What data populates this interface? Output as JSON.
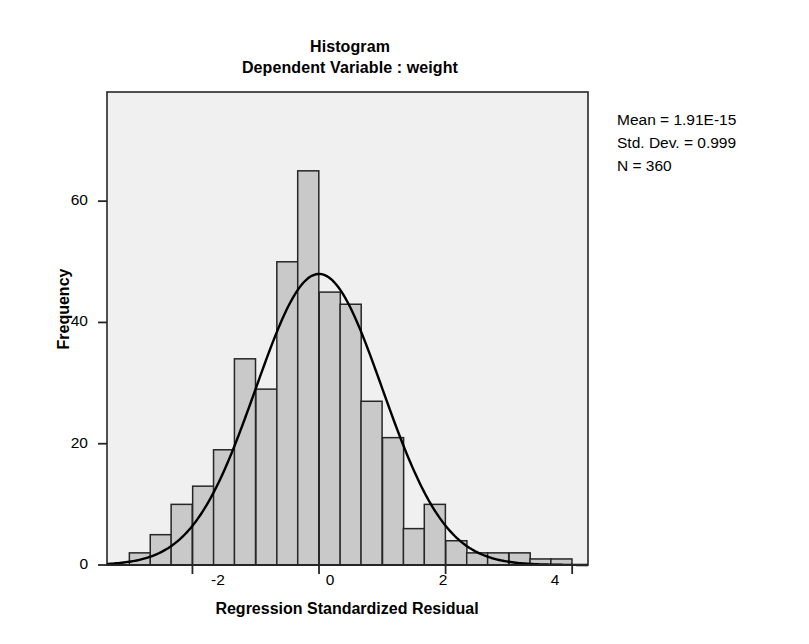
{
  "titles": {
    "main": "Histogram",
    "sub": "Dependent Variable : weight"
  },
  "stats": {
    "mean_line": "Mean = 1.91E-15",
    "sd_line": "Std. Dev. = 0.999",
    "n_line": "N = 360"
  },
  "axes": {
    "xlabel": "Regression Standardized Residual",
    "ylabel": "Frequency",
    "xticks": [
      "-2",
      "0",
      "2",
      "4"
    ],
    "yticks": [
      "0",
      "20",
      "40",
      "60"
    ]
  },
  "chart_data": {
    "type": "bar",
    "subtype": "histogram-with-normal-curve",
    "title": "Histogram",
    "subtitle": "Dependent Variable : weight",
    "xlabel": "Regression Standardized Residual",
    "ylabel": "Frequency",
    "xlim": [
      -3.35,
      4.25
    ],
    "ylim": [
      0,
      78
    ],
    "xticks": [
      -2,
      0,
      2,
      4
    ],
    "yticks": [
      0,
      20,
      40,
      60
    ],
    "grid": false,
    "legend": false,
    "bin_width": 0.3333,
    "bar_fill": "#c9c9c9",
    "bar_edge": "#262626",
    "plot_background": "#f0f0f0",
    "curve_color": "#000000",
    "statistics": {
      "mean": "1.91E-15",
      "std_dev": 0.999,
      "n": 360
    },
    "normal_curve": {
      "mean": 0,
      "sd": 0.999,
      "peak_frequency": 48
    },
    "bins": [
      {
        "center": -2.83,
        "value": 2
      },
      {
        "center": -2.5,
        "value": 5
      },
      {
        "center": -2.17,
        "value": 10
      },
      {
        "center": -1.83,
        "value": 13
      },
      {
        "center": -1.5,
        "value": 19
      },
      {
        "center": -1.17,
        "value": 34
      },
      {
        "center": -0.83,
        "value": 29
      },
      {
        "center": -0.5,
        "value": 50
      },
      {
        "center": -0.17,
        "value": 65
      },
      {
        "center": 0.17,
        "value": 45
      },
      {
        "center": 0.5,
        "value": 43
      },
      {
        "center": 0.83,
        "value": 27
      },
      {
        "center": 1.17,
        "value": 21
      },
      {
        "center": 1.5,
        "value": 6
      },
      {
        "center": 1.83,
        "value": 10
      },
      {
        "center": 2.17,
        "value": 4
      },
      {
        "center": 2.5,
        "value": 2
      },
      {
        "center": 2.83,
        "value": 2
      },
      {
        "center": 3.17,
        "value": 2
      },
      {
        "center": 3.5,
        "value": 1
      },
      {
        "center": 3.83,
        "value": 1
      }
    ]
  }
}
